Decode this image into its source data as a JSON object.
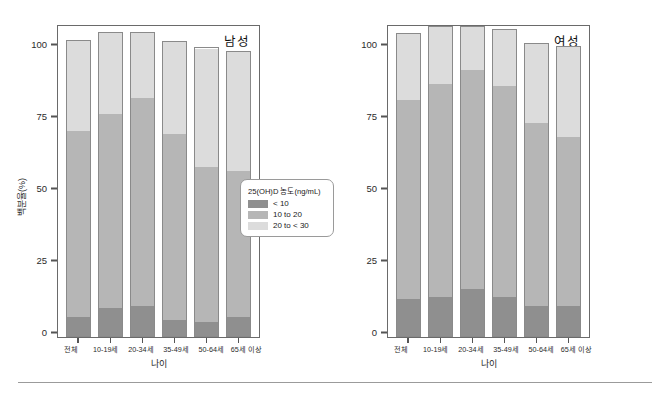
{
  "figure": {
    "ylabel": "백분율(%)",
    "xlabel": "나이",
    "y_ticks": [
      "100",
      "75",
      "50",
      "25",
      "0"
    ],
    "categories": [
      "전체",
      "10-19세",
      "20-34세",
      "35-49세",
      "50-64세",
      "65세 이상"
    ],
    "legend": {
      "title": "25(OH)D 농도(ng/mL)",
      "items": [
        {
          "label": "< 10",
          "color": "#8f8f8f"
        },
        {
          "label": "10 to 20",
          "color": "#b6b6b6"
        },
        {
          "label": "20 to < 30",
          "color": "#dcdcdc"
        }
      ]
    },
    "panels": [
      {
        "title": "남성"
      },
      {
        "title": "여성"
      }
    ]
  },
  "chart_data": [
    {
      "type": "bar",
      "title": "남성",
      "subtitle": "",
      "xlabel": "나이",
      "ylabel": "백분율(%)",
      "ylim": [
        0,
        100
      ],
      "yticks": [
        0,
        25,
        50,
        75,
        100
      ],
      "grid": false,
      "stacked": true,
      "legend_position": "right-outside",
      "legend_title": "25(OH)D 농도(ng/mL)",
      "categories": [
        "전체",
        "10-19세",
        "20-34세",
        "35-49세",
        "50-64세",
        "65세 이상"
      ],
      "series": [
        {
          "name": "< 10",
          "color": "#8f8f8f",
          "values": [
            6.0,
            9.0,
            9.5,
            5.0,
            4.5,
            6.0
          ]
        },
        {
          "name": "10 to 20",
          "color": "#b6b6b6",
          "values": [
            60.0,
            62.5,
            67.0,
            60.0,
            50.0,
            47.0
          ]
        },
        {
          "name": "20 to < 30",
          "color": "#dcdcdc",
          "values": [
            29.0,
            26.0,
            21.0,
            29.5,
            38.0,
            38.5
          ]
        }
      ],
      "cumulative_tops": [
        95.0,
        97.5,
        97.5,
        94.5,
        92.5,
        91.5
      ]
    },
    {
      "type": "bar",
      "title": "여성",
      "subtitle": "",
      "xlabel": "나이",
      "ylabel": "백분율(%)",
      "ylim": [
        0,
        100
      ],
      "yticks": [
        0,
        25,
        50,
        75,
        100
      ],
      "grid": false,
      "stacked": true,
      "legend_position": "right-outside",
      "legend_title": "25(OH)D 농도(ng/mL)",
      "categories": [
        "전체",
        "10-19세",
        "20-34세",
        "35-49세",
        "50-64세",
        "65세 이상"
      ],
      "series": [
        {
          "name": "< 10",
          "color": "#8f8f8f",
          "values": [
            12.0,
            12.5,
            15.0,
            12.5,
            9.5,
            9.5
          ]
        },
        {
          "name": "10 to 20",
          "color": "#b6b6b6",
          "values": [
            64.0,
            68.5,
            70.5,
            68.0,
            59.0,
            54.5
          ]
        },
        {
          "name": "20 to < 30",
          "color": "#dcdcdc",
          "values": [
            21.0,
            18.5,
            14.0,
            18.0,
            25.5,
            29.0
          ]
        }
      ],
      "cumulative_tops": [
        97.0,
        99.5,
        99.5,
        98.5,
        94.0,
        93.0
      ]
    }
  ]
}
